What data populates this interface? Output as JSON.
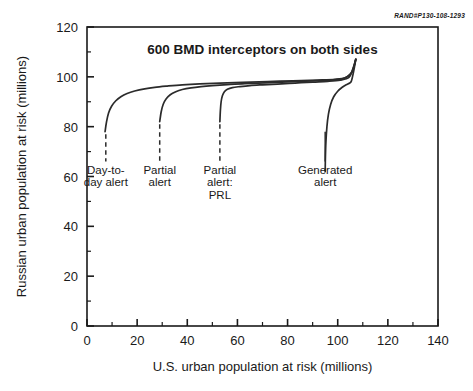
{
  "credit": {
    "text": "RAND#P130-108-1293"
  },
  "chart_data": {
    "type": "line",
    "title": "600 BMD interceptors on both sides",
    "xlabel": "U.S. urban population at risk (millions)",
    "ylabel": "Russian urban population at risk (millions)",
    "xlim": [
      0,
      140
    ],
    "ylim": [
      0,
      120
    ],
    "xticks": [
      0,
      20,
      40,
      60,
      80,
      100,
      120,
      140
    ],
    "yticks": [
      0,
      20,
      40,
      60,
      80,
      100,
      120
    ],
    "xtick_labels": [
      "0",
      "20",
      "40",
      "60",
      "80",
      "100",
      "120",
      "140"
    ],
    "ytick_labels": [
      "0",
      "20",
      "40",
      "60",
      "80",
      "100",
      "120"
    ],
    "xminor_step": 10,
    "yminor_step": 10,
    "grid": false,
    "legend": "inline-labels-below-curves",
    "series": [
      {
        "name": "Day-to-day alert",
        "label": "Day-to-day alert",
        "label_lines": [
          "Day-to-",
          "day alert"
        ],
        "leader": {
          "x": 7.5,
          "y_top": 77.0,
          "y_bottom": 66.0,
          "style": "dashed"
        },
        "points": [
          [
            7.2,
            78.0
          ],
          [
            7.8,
            82.0
          ],
          [
            8.6,
            85.5
          ],
          [
            9.8,
            88.2
          ],
          [
            11.5,
            90.4
          ],
          [
            13.5,
            92.0
          ],
          [
            16.0,
            93.3
          ],
          [
            19.0,
            94.3
          ],
          [
            23.0,
            95.2
          ],
          [
            27.0,
            95.8
          ],
          [
            32.0,
            96.3
          ],
          [
            38.0,
            96.8
          ],
          [
            45.0,
            97.2
          ],
          [
            53.0,
            97.5
          ],
          [
            62.0,
            97.8
          ],
          [
            72.0,
            98.1
          ],
          [
            82.0,
            98.4
          ],
          [
            92.0,
            98.7
          ],
          [
            99.0,
            99.0
          ],
          [
            103.0,
            99.6
          ],
          [
            105.5,
            101.5
          ],
          [
            106.6,
            104.5
          ],
          [
            107.2,
            107.0
          ]
        ]
      },
      {
        "name": "Partial alert",
        "label": "Partial alert",
        "label_lines": [
          "Partial",
          "alert"
        ],
        "leader": {
          "x": 29.0,
          "y_top": 81.0,
          "y_bottom": 66.0,
          "style": "dashed"
        },
        "points": [
          [
            29.0,
            82.0
          ],
          [
            29.6,
            86.0
          ],
          [
            30.4,
            89.0
          ],
          [
            31.6,
            91.2
          ],
          [
            33.2,
            92.8
          ],
          [
            35.4,
            94.0
          ],
          [
            38.0,
            94.9
          ],
          [
            41.5,
            95.6
          ],
          [
            45.5,
            96.1
          ],
          [
            50.0,
            96.5
          ],
          [
            56.0,
            96.9
          ],
          [
            63.0,
            97.3
          ],
          [
            71.0,
            97.6
          ],
          [
            80.0,
            98.0
          ],
          [
            90.0,
            98.4
          ],
          [
            98.0,
            98.8
          ],
          [
            102.5,
            99.4
          ],
          [
            105.2,
            101.3
          ],
          [
            106.5,
            104.3
          ],
          [
            107.2,
            107.0
          ]
        ]
      },
      {
        "name": "Partial alert: PRL",
        "label": "Partial alert: PRL",
        "label_lines": [
          "Partial",
          "alert:",
          "PRL"
        ],
        "leader": {
          "x": 53.0,
          "y_top": 81.0,
          "y_bottom": 66.0,
          "style": "dashed"
        },
        "points": [
          [
            53.0,
            82.0
          ],
          [
            53.2,
            86.5
          ],
          [
            53.5,
            90.0
          ],
          [
            54.0,
            92.4
          ],
          [
            54.8,
            94.0
          ],
          [
            56.0,
            95.0
          ],
          [
            58.0,
            95.7
          ],
          [
            61.0,
            96.1
          ],
          [
            65.0,
            96.5
          ],
          [
            70.0,
            96.8
          ],
          [
            76.0,
            97.1
          ],
          [
            83.0,
            97.5
          ],
          [
            90.0,
            97.9
          ],
          [
            96.0,
            98.2
          ],
          [
            101.0,
            98.7
          ],
          [
            104.5,
            99.8
          ],
          [
            106.0,
            103.0
          ],
          [
            107.2,
            107.0
          ]
        ]
      },
      {
        "name": "Generated alert",
        "label": "Generated alert",
        "label_lines": [
          "Generated",
          "alert"
        ],
        "leader": {
          "x": 95.0,
          "y_top": 78.0,
          "y_bottom": 66.0,
          "style": "solid"
        },
        "points": [
          [
            95.0,
            62.0
          ],
          [
            95.1,
            68.0
          ],
          [
            95.3,
            74.0
          ],
          [
            95.7,
            80.0
          ],
          [
            96.3,
            85.0
          ],
          [
            97.2,
            89.0
          ],
          [
            98.4,
            92.0
          ],
          [
            100.0,
            94.2
          ],
          [
            101.8,
            95.8
          ],
          [
            103.4,
            96.8
          ],
          [
            104.6,
            97.4
          ],
          [
            105.4,
            98.2
          ],
          [
            106.0,
            100.5
          ],
          [
            106.6,
            103.5
          ],
          [
            107.2,
            107.0
          ]
        ]
      }
    ]
  }
}
